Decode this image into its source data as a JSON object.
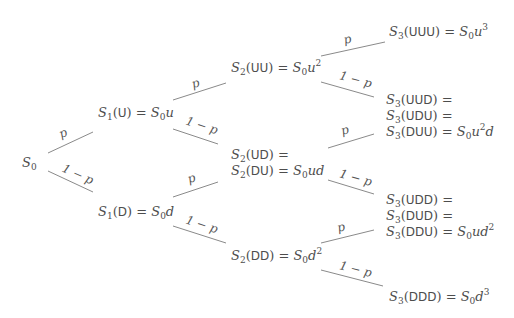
{
  "diagram": {
    "type": "binomial-tree",
    "steps": 3,
    "edge_labels": {
      "up": "p",
      "down": "1 − p"
    },
    "nodes": {
      "s0": {
        "id": "S0",
        "lines": [
          {
            "sym": "S",
            "sub": "0",
            "path": "",
            "rhs": ""
          }
        ]
      },
      "s1u": {
        "id": "S1(U)",
        "lines": [
          {
            "sym": "S",
            "sub": "1",
            "path": "U",
            "rhs_base": "S",
            "rhs_sub": "0",
            "rhs_var": "u",
            "rhs_exp": ""
          }
        ]
      },
      "s1d": {
        "id": "S1(D)",
        "lines": [
          {
            "sym": "S",
            "sub": "1",
            "path": "D",
            "rhs_base": "S",
            "rhs_sub": "0",
            "rhs_var": "d",
            "rhs_exp": ""
          }
        ]
      },
      "s2uu": {
        "id": "S2(UU)",
        "lines": [
          {
            "sym": "S",
            "sub": "2",
            "path": "UU",
            "rhs_base": "S",
            "rhs_sub": "0",
            "rhs_var": "u",
            "rhs_exp": "2"
          }
        ]
      },
      "s2ud": {
        "id": "S2(UD)=S2(DU)",
        "lines": [
          {
            "sym": "S",
            "sub": "2",
            "path": "UD",
            "rhs_base": "",
            "rhs_sub": "",
            "rhs_var": "",
            "rhs_exp": ""
          },
          {
            "sym": "S",
            "sub": "2",
            "path": "DU",
            "rhs_base": "S",
            "rhs_sub": "0",
            "rhs_var": "ud",
            "rhs_exp": ""
          }
        ]
      },
      "s2dd": {
        "id": "S2(DD)",
        "lines": [
          {
            "sym": "S",
            "sub": "2",
            "path": "DD",
            "rhs_base": "S",
            "rhs_sub": "0",
            "rhs_var": "d",
            "rhs_exp": "2"
          }
        ]
      },
      "s3uuu": {
        "id": "S3(UUU)",
        "lines": [
          {
            "sym": "S",
            "sub": "3",
            "path": "UUU",
            "rhs_base": "S",
            "rhs_sub": "0",
            "rhs_var": "u",
            "rhs_exp": "3"
          }
        ]
      },
      "s3uud": {
        "id": "S3(UUD)=S3(UDU)=S3(DUU)",
        "lines": [
          {
            "sym": "S",
            "sub": "3",
            "path": "UUD",
            "rhs_base": "",
            "rhs_sub": "",
            "rhs_var": "",
            "rhs_exp": ""
          },
          {
            "sym": "S",
            "sub": "3",
            "path": "UDU",
            "rhs_base": "",
            "rhs_sub": "",
            "rhs_var": "",
            "rhs_exp": ""
          },
          {
            "sym": "S",
            "sub": "3",
            "path": "DUU",
            "rhs_base": "S",
            "rhs_sub": "0",
            "rhs_var": "u",
            "rhs_exp": "2",
            "rhs_tail": "d"
          }
        ]
      },
      "s3udd": {
        "id": "S3(UDD)=S3(DUD)=S3(DDU)",
        "lines": [
          {
            "sym": "S",
            "sub": "3",
            "path": "UDD",
            "rhs_base": "",
            "rhs_sub": "",
            "rhs_var": "",
            "rhs_exp": ""
          },
          {
            "sym": "S",
            "sub": "3",
            "path": "DUD",
            "rhs_base": "",
            "rhs_sub": "",
            "rhs_var": "",
            "rhs_exp": ""
          },
          {
            "sym": "S",
            "sub": "3",
            "path": "DDU",
            "rhs_base": "S",
            "rhs_sub": "0",
            "rhs_var": "ud",
            "rhs_exp": "2"
          }
        ]
      },
      "s3ddd": {
        "id": "S3(DDD)",
        "lines": [
          {
            "sym": "S",
            "sub": "3",
            "path": "DDD",
            "rhs_base": "S",
            "rhs_sub": "0",
            "rhs_var": "d",
            "rhs_exp": "3"
          }
        ]
      }
    },
    "text": {
      "S": "S",
      "eq": " = ",
      "lp": "(",
      "rp": ")",
      "sub0": "0",
      "sub1": "1",
      "sub2": "2",
      "sub3": "3",
      "U": "U",
      "D": "D",
      "UU": "UU",
      "UD": "UD",
      "DU": "DU",
      "DD": "DD",
      "UUU": "UUU",
      "UUD": "UUD",
      "UDU": "UDU",
      "DUU": "DUU",
      "UDD": "UDD",
      "DUD": "DUD",
      "DDU": "DDU",
      "DDD": "DDD",
      "u": "u",
      "d": "d",
      "ud": "ud",
      "exp2": "2",
      "exp3": "3"
    },
    "colors": {
      "text": "#4d4d4d",
      "edge": "#8a8a8a",
      "background": "#ffffff"
    }
  }
}
